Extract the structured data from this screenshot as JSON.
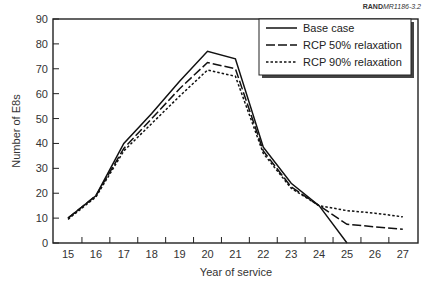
{
  "figure_id": {
    "bold": "RAND",
    "italic": "MR1186-3.2"
  },
  "chart_data": {
    "type": "line",
    "title": "",
    "xlabel": "Year of service",
    "ylabel": "Number of E8s",
    "x": [
      15,
      16,
      17,
      18,
      19,
      20,
      21,
      22,
      23,
      24,
      25,
      26,
      27
    ],
    "ylim": [
      0,
      90
    ],
    "yticks": [
      0,
      10,
      20,
      30,
      40,
      50,
      60,
      70,
      80,
      90
    ],
    "grid": false,
    "legend_position": "upper right",
    "series": [
      {
        "name": "Base case",
        "style": "solid",
        "values": [
          10,
          19,
          40,
          52,
          65,
          77,
          74,
          38.5,
          24,
          15,
          0,
          null,
          null
        ]
      },
      {
        "name": "RCP 50% relaxation",
        "style": "dashed",
        "values": [
          10,
          19,
          38,
          50,
          62,
          72.5,
          70,
          37,
          22.5,
          15,
          7.5,
          6.5,
          5.5
        ]
      },
      {
        "name": "RCP 90% relaxation",
        "style": "dotted",
        "values": [
          9.5,
          18.5,
          37,
          48,
          59,
          69.5,
          67,
          36,
          22,
          15,
          13,
          12,
          10.5
        ]
      }
    ]
  }
}
